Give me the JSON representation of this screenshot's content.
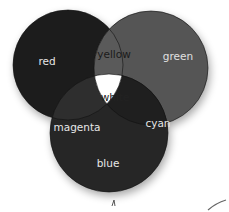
{
  "diagram": {
    "type": "venn",
    "circles": [
      {
        "id": "red",
        "label": "red",
        "cx": 68,
        "cy": 65,
        "r": 55,
        "fill": "#1c1c1c"
      },
      {
        "id": "green",
        "label": "green",
        "cx": 151,
        "cy": 68,
        "r": 57,
        "fill": "#545454"
      },
      {
        "id": "blue",
        "label": "blue",
        "cx": 109,
        "cy": 133,
        "r": 59,
        "fill": "#262626"
      }
    ],
    "regions": {
      "red": {
        "label": "red",
        "x": 47,
        "y": 62,
        "text_color": "#e6e6e6"
      },
      "green": {
        "label": "green",
        "x": 175,
        "y": 57,
        "text_color": "#e0e0e0"
      },
      "blue": {
        "label": "blue",
        "x": 108,
        "y": 164,
        "text_color": "#e6e6e6"
      },
      "yellow": {
        "label": "yellow",
        "x": 114,
        "y": 55,
        "text_color": "#1a1a1a",
        "fill": "#5a5a5a"
      },
      "magenta": {
        "label": "magenta",
        "x": 76,
        "y": 127,
        "text_color": "#e6e6e6",
        "fill": "#2e2e2e"
      },
      "cyan": {
        "label": "cyan",
        "x": 157,
        "y": 124,
        "text_color": "#e6e6e6",
        "fill": "#1f1f1f"
      },
      "white": {
        "label": "white",
        "x": 115,
        "y": 98,
        "text_color": "#222222",
        "fill": "#ffffff"
      }
    }
  }
}
